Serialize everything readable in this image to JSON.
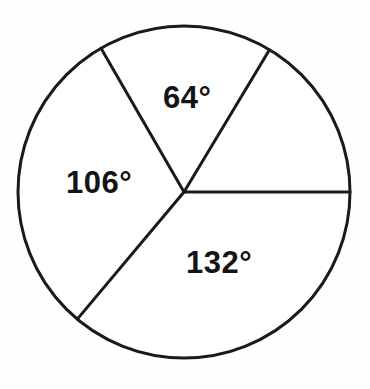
{
  "figure": {
    "kind": "circle-with-central-angles",
    "background_color": "#fefefe",
    "stroke_color": "#1a1a1a",
    "stroke_width": 3,
    "text_color": "#141414"
  },
  "chart_data": {
    "type": "pie",
    "title": "",
    "subtitle": "",
    "xlabel": "",
    "ylabel": "",
    "grid": false,
    "legend_position": "none",
    "units": "degrees",
    "total_degrees": 360,
    "center": {
      "x": 184,
      "y": 192
    },
    "radius": 166,
    "angle_convention": "degrees measured counterclockwise from the positive x-axis (3 o'clock)",
    "boundary_angles_deg": [
      0,
      59,
      120,
      230
    ],
    "categories": [
      "unlabeled-right",
      "top",
      "left",
      "bottom"
    ],
    "values": [
      59,
      64,
      106,
      132
    ],
    "slices": [
      {
        "name": "unlabeled-right",
        "label": "",
        "labeled": false,
        "value_deg": 59,
        "start_angle_deg": 0,
        "end_angle_deg": 59,
        "fill": "#ffffff"
      },
      {
        "name": "top",
        "label": "64°",
        "labeled": true,
        "value_deg": 64,
        "start_angle_deg": 59,
        "end_angle_deg": 120,
        "fill": "#ffffff"
      },
      {
        "name": "left",
        "label": "106°",
        "labeled": true,
        "value_deg": 106,
        "start_angle_deg": 120,
        "end_angle_deg": 230,
        "fill": "#ffffff"
      },
      {
        "name": "bottom",
        "label": "132°",
        "labeled": true,
        "value_deg": 132,
        "start_angle_deg": 230,
        "end_angle_deg": 360,
        "fill": "#ffffff"
      }
    ],
    "annotations": [
      {
        "text": "64°",
        "x": 190,
        "y": 100
      },
      {
        "text": "106°",
        "x": 106,
        "y": 185
      },
      {
        "text": "132°",
        "x": 225,
        "y": 265
      }
    ]
  },
  "labels": {
    "top_sector": "64°",
    "left_sector": "106°",
    "bottom_sector": "132°"
  }
}
